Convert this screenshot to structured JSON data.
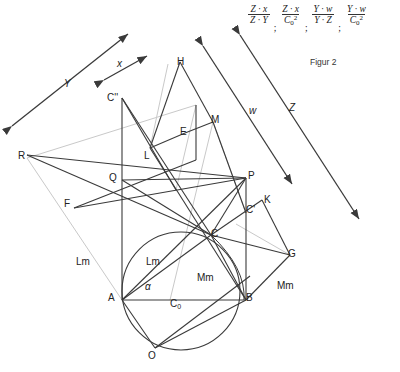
{
  "figure": {
    "caption": "Figur 2",
    "formula": {
      "terms": [
        {
          "num": "Z · x",
          "den": "Z · Y",
          "sep": ";"
        },
        {
          "num": "Z · x",
          "den": "C0 2",
          "sep": ";"
        },
        {
          "num": "Y · w",
          "den": "Y · Z",
          "sep": ";"
        },
        {
          "num": "Y · w",
          "den": "C0 2",
          "sep": ""
        }
      ]
    },
    "direction_arrows": [
      {
        "name": "Y",
        "label": "Y"
      },
      {
        "name": "x",
        "label": "x"
      },
      {
        "name": "w",
        "label": "w"
      },
      {
        "name": "Z",
        "label": "Z"
      }
    ],
    "points": [
      {
        "id": "C2",
        "label": "C''",
        "x": 107,
        "y": 92
      },
      {
        "id": "H",
        "label": "H",
        "x": 177,
        "y": 56
      },
      {
        "id": "M",
        "label": "M",
        "x": 211,
        "y": 114
      },
      {
        "id": "E",
        "label": "E",
        "x": 180,
        "y": 126
      },
      {
        "id": "L",
        "label": "L",
        "x": 144,
        "y": 150
      },
      {
        "id": "R",
        "label": "R",
        "x": 18,
        "y": 150
      },
      {
        "id": "Q",
        "label": "Q",
        "x": 109,
        "y": 172
      },
      {
        "id": "P",
        "label": "P",
        "x": 248,
        "y": 170
      },
      {
        "id": "F",
        "label": "F",
        "x": 64,
        "y": 198
      },
      {
        "id": "K",
        "label": "K",
        "x": 264,
        "y": 194
      },
      {
        "id": "C1",
        "label": "C'",
        "x": 246,
        "y": 204
      },
      {
        "id": "C",
        "label": "C",
        "x": 211,
        "y": 228
      },
      {
        "id": "G",
        "label": "G",
        "x": 288,
        "y": 248
      },
      {
        "id": "A",
        "label": "A",
        "x": 108,
        "y": 292
      },
      {
        "id": "B",
        "label": "B",
        "x": 246,
        "y": 292
      },
      {
        "id": "O",
        "label": "O",
        "x": 148,
        "y": 350
      }
    ],
    "segment_labels": [
      {
        "id": "Lm-left",
        "label": "Lm",
        "x": 76,
        "y": 256
      },
      {
        "id": "Lm-mid",
        "label": "Lm",
        "x": 146,
        "y": 256
      },
      {
        "id": "Mm-mid",
        "label": "Mm",
        "x": 197,
        "y": 272
      },
      {
        "id": "Mm-right",
        "label": "Mm",
        "x": 277,
        "y": 280
      },
      {
        "id": "alpha",
        "label": "α",
        "x": 145,
        "y": 281
      },
      {
        "id": "C0",
        "label": "C",
        "sub": "0",
        "x": 170,
        "y": 298
      }
    ],
    "colors": {
      "line_dark": "#3a3a3a",
      "line_light": "#c9c9c9",
      "line_mid": "#6e6e6e",
      "text": "#1a1a1a",
      "background": "#ffffff"
    }
  }
}
